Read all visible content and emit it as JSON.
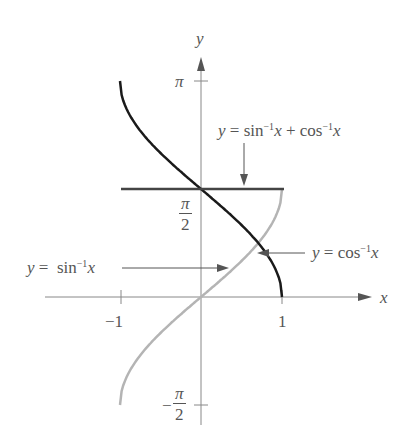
{
  "chart_data": {
    "type": "line",
    "title": "",
    "xlabel": "x",
    "ylabel": "y",
    "xlim": [
      -1,
      1
    ],
    "ylim": [
      -1.5708,
      3.1416
    ],
    "x_ticks": [
      "-1",
      "1"
    ],
    "y_ticks": [
      "π",
      "π/2",
      "-π/2"
    ],
    "grid": false,
    "series": [
      {
        "name": "y = sin⁻¹x",
        "color": "#b4b4b4",
        "x": [
          -1,
          -0.5,
          0,
          0.5,
          1
        ],
        "values": [
          -1.5708,
          -0.5236,
          0,
          0.5236,
          1.5708
        ]
      },
      {
        "name": "y = cos⁻¹x",
        "color": "#1a1a1a",
        "x": [
          -1,
          -0.5,
          0,
          0.5,
          1
        ],
        "values": [
          3.1416,
          2.0944,
          1.5708,
          1.0472,
          0
        ]
      },
      {
        "name": "y = sin⁻¹x + cos⁻¹x",
        "color": "#444444",
        "x": [
          -1,
          1
        ],
        "values": [
          1.5708,
          1.5708
        ]
      }
    ],
    "annotations": [
      "y = sin⁻¹x + cos⁻¹x",
      "y = sin⁻¹x",
      "y = cos⁻¹x"
    ]
  },
  "labels": {
    "y_axis": "y",
    "x_axis": "x",
    "pi": "π",
    "pi_half_num": "π",
    "pi_half_den": "2",
    "neg_pi_half_sign": "−",
    "neg_pi_half_num": "π",
    "neg_pi_half_den": "2",
    "x_neg1": "−1",
    "x_pos1": "1"
  }
}
